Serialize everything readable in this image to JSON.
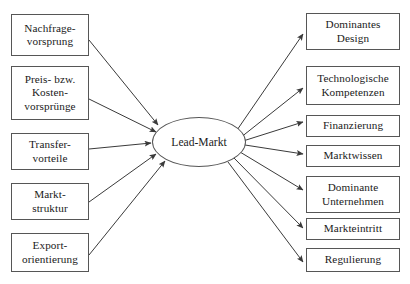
{
  "diagram": {
    "type": "influence-diagram",
    "center": {
      "id": "lead-markt",
      "label": "Lead-Markt",
      "shape": "ellipse",
      "x": 152,
      "y": 117,
      "w": 94,
      "h": 50
    },
    "drivers_heading": "",
    "drivers": [
      {
        "id": "nachfragevorsprung",
        "label": "Nachfrage-\nvorsprung",
        "x": 11,
        "y": 14,
        "w": 78,
        "h": 42
      },
      {
        "id": "preis-kostenvorspruenge",
        "label": "Preis- bzw.\nKosten-\nvorsprünge",
        "x": 11,
        "y": 66,
        "w": 78,
        "h": 54
      },
      {
        "id": "transfervorteile",
        "label": "Transfer-\nvorteile",
        "x": 11,
        "y": 133,
        "w": 78,
        "h": 37
      },
      {
        "id": "marktstruktur",
        "label": "Markt-\nstruktur",
        "x": 11,
        "y": 183,
        "w": 78,
        "h": 37
      },
      {
        "id": "exportorientierung",
        "label": "Export-\norientierung",
        "x": 11,
        "y": 233,
        "w": 78,
        "h": 39
      }
    ],
    "outcomes": [
      {
        "id": "dominantes-design",
        "label": "Dominantes\nDesign",
        "x": 306,
        "y": 13,
        "w": 94,
        "h": 37
      },
      {
        "id": "technologische-kompetenzen",
        "label": "Technologische\nKompetenzen",
        "x": 306,
        "y": 66,
        "w": 94,
        "h": 39
      },
      {
        "id": "finanzierung",
        "label": "Finanzierung",
        "x": 306,
        "y": 115,
        "w": 94,
        "h": 22
      },
      {
        "id": "marktwissen",
        "label": "Marktwissen",
        "x": 306,
        "y": 145,
        "w": 94,
        "h": 22
      },
      {
        "id": "dominante-unternehmen",
        "label": "Dominante\nUnternehmen",
        "x": 306,
        "y": 176,
        "w": 94,
        "h": 37
      },
      {
        "id": "markteintritt",
        "label": "Markteintritt",
        "x": 306,
        "y": 218,
        "w": 94,
        "h": 22
      },
      {
        "id": "regulierung",
        "label": "Regulierung",
        "x": 306,
        "y": 248,
        "w": 94,
        "h": 24
      }
    ],
    "edges_in": [
      {
        "from": "nachfragevorsprung",
        "to": "lead-markt",
        "x1": 89,
        "y1": 40,
        "x2": 158,
        "y2": 125
      },
      {
        "from": "preis-kostenvorspruenge",
        "to": "lead-markt",
        "x1": 89,
        "y1": 99,
        "x2": 156,
        "y2": 132
      },
      {
        "from": "transfervorteile",
        "to": "lead-markt",
        "x1": 89,
        "y1": 149,
        "x2": 151,
        "y2": 143
      },
      {
        "from": "marktstruktur",
        "to": "lead-markt",
        "x1": 89,
        "y1": 202,
        "x2": 156,
        "y2": 154
      },
      {
        "from": "exportorientierung",
        "to": "lead-markt",
        "x1": 89,
        "y1": 255,
        "x2": 165,
        "y2": 161
      }
    ],
    "edges_out": [
      {
        "from": "lead-markt",
        "to": "dominantes-design",
        "x1": 235,
        "y1": 133,
        "x2": 303,
        "y2": 34
      },
      {
        "from": "lead-markt",
        "to": "technologische-kompetenzen",
        "x1": 240,
        "y1": 138,
        "x2": 303,
        "y2": 88
      },
      {
        "from": "lead-markt",
        "to": "finanzierung",
        "x1": 243,
        "y1": 141,
        "x2": 303,
        "y2": 122
      },
      {
        "from": "lead-markt",
        "to": "marktwissen",
        "x1": 245,
        "y1": 145,
        "x2": 303,
        "y2": 154
      },
      {
        "from": "lead-markt",
        "to": "dominante-unternehmen",
        "x1": 240,
        "y1": 152,
        "x2": 303,
        "y2": 190
      },
      {
        "from": "lead-markt",
        "to": "markteintritt",
        "x1": 234,
        "y1": 158,
        "x2": 303,
        "y2": 228
      },
      {
        "from": "lead-markt",
        "to": "regulierung",
        "x1": 228,
        "y1": 162,
        "x2": 303,
        "y2": 262
      }
    ],
    "style": {
      "line_color": "#3a3a3a",
      "box_border": "#565656",
      "text_color": "#1a1a1a",
      "background": "#ffffff"
    }
  }
}
